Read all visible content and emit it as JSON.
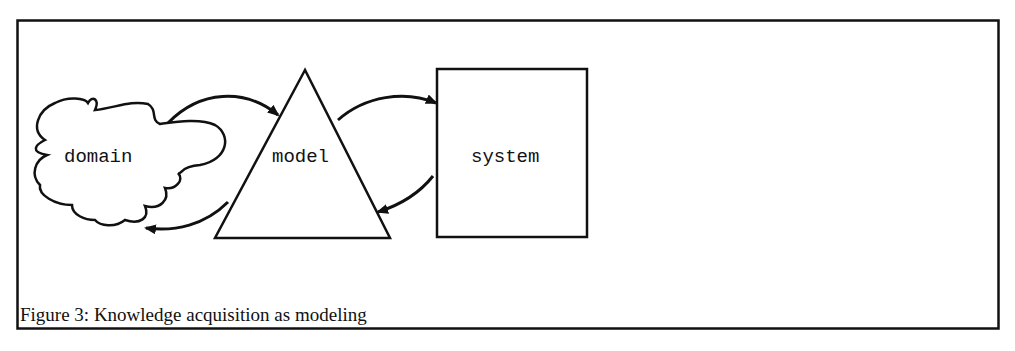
{
  "figure": {
    "caption": "Figure 3: Knowledge acquisition as modeling",
    "nodes": [
      {
        "id": "domain",
        "label": "domain",
        "shape": "cloud"
      },
      {
        "id": "model",
        "label": "model",
        "shape": "triangle"
      },
      {
        "id": "system",
        "label": "system",
        "shape": "rectangle"
      }
    ],
    "edges": [
      {
        "from": "domain",
        "to": "model"
      },
      {
        "from": "model",
        "to": "domain"
      },
      {
        "from": "model",
        "to": "system"
      },
      {
        "from": "system",
        "to": "model"
      }
    ]
  }
}
